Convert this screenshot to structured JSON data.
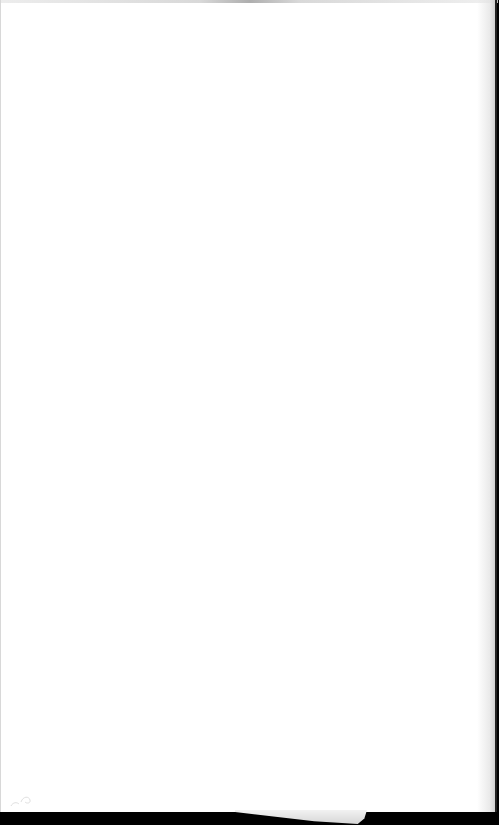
{
  "document": {
    "type": "blank-page",
    "text": "",
    "background_color": "#ffffff",
    "surround_color": "#000000"
  }
}
